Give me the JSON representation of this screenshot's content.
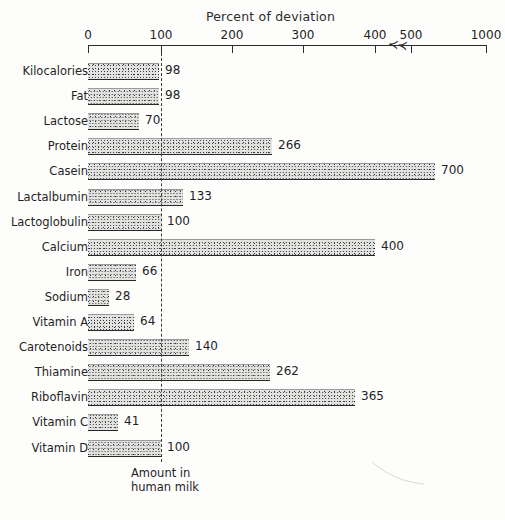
{
  "chart_data": {
    "type": "bar",
    "orientation": "horizontal",
    "title": "Percent of deviation",
    "xlabel": "Percent of deviation",
    "ylabel": "",
    "grid": false,
    "legend": null,
    "axis_break": {
      "after": 400,
      "before": 500,
      "marker": "≺≺"
    },
    "xticks": [
      0,
      100,
      200,
      300,
      400,
      500,
      1000
    ],
    "xtick_labels": [
      "0",
      "100",
      "200",
      "300",
      "400",
      "500",
      "1000"
    ],
    "xlim": [
      0,
      1000
    ],
    "reference_line": {
      "value": 100,
      "style": "dashed",
      "label_line1": "Amount in",
      "label_line2": "human milk"
    },
    "categories": [
      "Kilocalories",
      "Fat",
      "Lactose",
      "Protein",
      "Casein",
      "Lactalbumin",
      "Lactoglobulin",
      "Calcium",
      "Iron",
      "Sodium",
      "Vitamin A",
      "Carotenoids",
      "Thiamine",
      "Riboflavin",
      "Vitamin C",
      "Vitamin D"
    ],
    "values": [
      98,
      98,
      70,
      266,
      700,
      133,
      100,
      400,
      66,
      28,
      64,
      140,
      262,
      365,
      41,
      100
    ],
    "value_labels": [
      "98",
      "98",
      "70",
      "266",
      "700",
      "133",
      "100",
      "400",
      "66",
      "28",
      "64",
      "140",
      "262",
      "365",
      "41",
      "100"
    ],
    "bar_pixel_ends": [
      159,
      159,
      139,
      272,
      435,
      183,
      161,
      375,
      136,
      109,
      134,
      189,
      270,
      355,
      118,
      161
    ]
  },
  "colors": {
    "ink": "#1f1f1f",
    "axis": "#2a2a2a",
    "bar_fill": "#e2e2e0",
    "bar_edge": "#272727",
    "background": "#fdfdfc"
  }
}
